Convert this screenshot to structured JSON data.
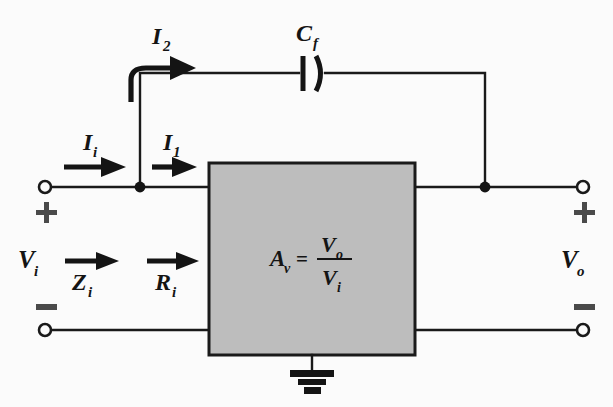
{
  "figure": {
    "type": "circuit-diagram",
    "background_color": "#fbfbfb",
    "line_color": "#1a1a1a",
    "amplifier_fill_color": "#bdbdbd"
  },
  "labels": {
    "current_i2": {
      "base": "I",
      "sub": "2"
    },
    "current_ii": {
      "base": "I",
      "sub": "i"
    },
    "current_i1": {
      "base": "I",
      "sub": "1"
    },
    "capacitor_cf": {
      "base": "C",
      "sub": "f"
    },
    "voltage_vi": {
      "base": "V",
      "sub": "i"
    },
    "voltage_vo": {
      "base": "V",
      "sub": "o"
    },
    "impedance_zi": {
      "base": "Z",
      "sub": "i"
    },
    "resistance_ri": {
      "base": "R",
      "sub": "i"
    },
    "gain_av": {
      "base": "A",
      "sub": "v"
    },
    "equals": "=",
    "gain_numerator": {
      "base": "V",
      "sub": "o"
    },
    "gain_denominator": {
      "base": "V",
      "sub": "i"
    },
    "plus_input": "+",
    "minus_input": "−",
    "plus_output": "+",
    "minus_output": "−"
  },
  "components": {
    "amplifier": {
      "name": "voltage-amplifier-block",
      "equation_text": "Av = Vo / Vi"
    },
    "capacitor": {
      "name": "feedback-capacitor",
      "designator": "Cf",
      "style": "polarized-curved-plate"
    },
    "ground": {
      "name": "chassis-ground",
      "style": "stacked-bars"
    },
    "terminals": [
      {
        "name": "input-positive-terminal",
        "polarity": "+"
      },
      {
        "name": "input-negative-terminal",
        "polarity": "−"
      },
      {
        "name": "output-positive-terminal",
        "polarity": "+"
      },
      {
        "name": "output-negative-terminal",
        "polarity": "−"
      }
    ],
    "nodes": [
      {
        "name": "input-junction-node"
      },
      {
        "name": "output-junction-node"
      }
    ]
  },
  "arrows": [
    {
      "name": "arrow-i2",
      "label": "I2",
      "direction": "curved-right",
      "label_position": "above"
    },
    {
      "name": "arrow-ii",
      "label": "Ii",
      "direction": "right",
      "label_position": "above"
    },
    {
      "name": "arrow-i1",
      "label": "I1",
      "direction": "right",
      "label_position": "above"
    },
    {
      "name": "arrow-zi",
      "label": "Zi",
      "direction": "right",
      "label_position": "below"
    },
    {
      "name": "arrow-ri",
      "label": "Ri",
      "direction": "right",
      "label_position": "below"
    }
  ]
}
